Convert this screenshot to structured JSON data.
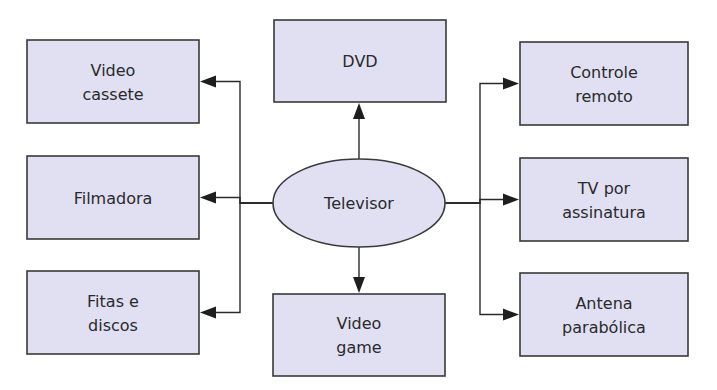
{
  "diagram": {
    "type": "concept-map",
    "center": {
      "id": "televisor",
      "label": [
        "Televisor"
      ]
    },
    "nodes": [
      {
        "id": "video-cassete",
        "label": [
          "Video",
          "cassete"
        ],
        "side": "left"
      },
      {
        "id": "filmadora",
        "label": [
          "Filmadora"
        ],
        "side": "left"
      },
      {
        "id": "fitas-e-discos",
        "label": [
          "Fitas e",
          "discos"
        ],
        "side": "left"
      },
      {
        "id": "dvd",
        "label": [
          "DVD"
        ],
        "side": "top"
      },
      {
        "id": "video-game",
        "label": [
          "Video",
          "game"
        ],
        "side": "bottom"
      },
      {
        "id": "controle-remoto",
        "label": [
          "Controle",
          "remoto"
        ],
        "side": "right"
      },
      {
        "id": "tv-por-assinatura",
        "label": [
          "TV por",
          "assinatura"
        ],
        "side": "right"
      },
      {
        "id": "antena-parabolica",
        "label": [
          "Antena",
          "parabólica"
        ],
        "side": "right"
      }
    ],
    "edges": [
      {
        "from": "televisor",
        "to": "video-cassete"
      },
      {
        "from": "televisor",
        "to": "filmadora"
      },
      {
        "from": "televisor",
        "to": "fitas-e-discos"
      },
      {
        "from": "televisor",
        "to": "dvd"
      },
      {
        "from": "televisor",
        "to": "video-game"
      },
      {
        "from": "televisor",
        "to": "controle-remoto"
      },
      {
        "from": "televisor",
        "to": "tv-por-assinatura"
      },
      {
        "from": "televisor",
        "to": "antena-parabolica"
      }
    ],
    "colors": {
      "node_fill": "#e1e0f3",
      "stroke": "#3a3a3a",
      "text": "#2a2a2a"
    }
  }
}
